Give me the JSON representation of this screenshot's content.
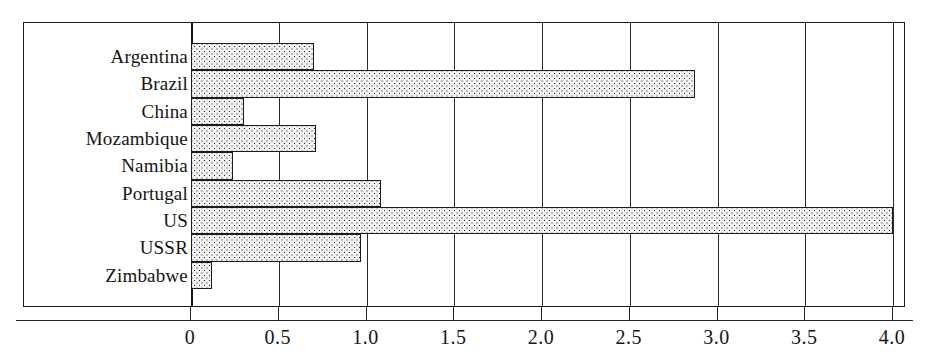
{
  "chart_data": {
    "type": "bar",
    "orientation": "horizontal",
    "title": "",
    "subtitle": "",
    "xlabel": "",
    "ylabel": "",
    "categories": [
      "Argentina",
      "Brazil",
      "China",
      "Mozambique",
      "Namibia",
      "Portugal",
      "US",
      "USSR",
      "Zimbabwe"
    ],
    "values": [
      0.7,
      2.87,
      0.3,
      0.71,
      0.24,
      1.08,
      4.0,
      0.97,
      0.12
    ],
    "series": [
      {
        "name": "",
        "values": [
          0.7,
          2.87,
          0.3,
          0.71,
          0.24,
          1.08,
          4.0,
          0.97,
          0.12
        ]
      }
    ],
    "xlim": [
      0,
      4.0
    ],
    "xticks": [
      0,
      0.5,
      1.0,
      1.5,
      2.0,
      2.5,
      3.0,
      3.5,
      4.0
    ],
    "xtick_labels": [
      "0",
      "0.5",
      "1.0",
      "1.5",
      "2.0",
      "2.5",
      "3.0",
      "3.5",
      "4.0"
    ],
    "grid": "vertical",
    "legend": "none",
    "bar_fill": "dotted-hatch",
    "bar_edge_color": "#1c1c1c",
    "bar_face_color": "#f2f2f2",
    "frame_color": "#1a1a1a"
  },
  "axis": {
    "tick_labels": [
      "0",
      "0.5",
      "1.0",
      "1.5",
      "2.0",
      "2.5",
      "3.0",
      "3.5",
      "4.0"
    ]
  },
  "categories": [
    {
      "label": "Argentina",
      "value": 0.7
    },
    {
      "label": "Brazil",
      "value": 2.87
    },
    {
      "label": "China",
      "value": 0.3
    },
    {
      "label": "Mozambique",
      "value": 0.71
    },
    {
      "label": "Namibia",
      "value": 0.24
    },
    {
      "label": "Portugal",
      "value": 1.08
    },
    {
      "label": "US",
      "value": 4.0
    },
    {
      "label": "USSR",
      "value": 0.97
    },
    {
      "label": "Zimbabwe",
      "value": 0.12
    }
  ]
}
